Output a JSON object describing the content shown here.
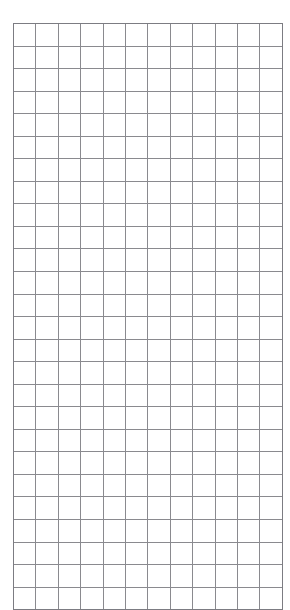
{
  "page": {
    "background_color": "#ffffff",
    "width": 290,
    "height": 610
  },
  "grid": {
    "name": "blank-square-grid-sheet",
    "columns": 12,
    "rows": 26,
    "cell_width": 21.4,
    "cell_height": 21.55,
    "origin_x": 13,
    "origin_y": 23,
    "line_color": "#8a8a8f",
    "border_color": "#7c7c82",
    "line_width": 1,
    "fill_color": "#ffffff",
    "cell_text": ""
  }
}
